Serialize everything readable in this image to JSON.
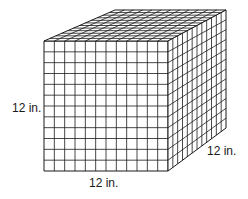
{
  "diagram": {
    "type": "cube",
    "grid_divisions": 12,
    "labels": {
      "height": "12 in.",
      "width": "12 in.",
      "depth": "12 in."
    },
    "colors": {
      "line": "#1a1a1a",
      "face": "#ffffff"
    }
  }
}
